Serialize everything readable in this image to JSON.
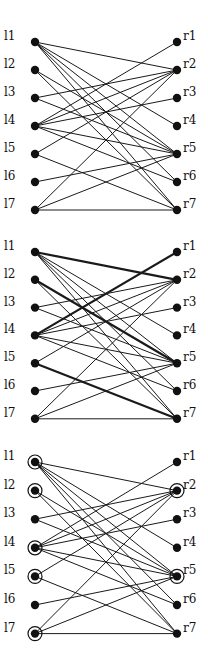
{
  "diagram": {
    "type": "bipartite-graphs",
    "left_nodes": [
      "l1",
      "l2",
      "l3",
      "l4",
      "l5",
      "l6",
      "l7"
    ],
    "right_nodes": [
      "r1",
      "r2",
      "r3",
      "r4",
      "r5",
      "r6",
      "r7"
    ],
    "edges": [
      [
        "l1",
        "r2"
      ],
      [
        "l1",
        "r4"
      ],
      [
        "l1",
        "r5"
      ],
      [
        "l1",
        "r7"
      ],
      [
        "l1",
        "r6"
      ],
      [
        "l2",
        "r5"
      ],
      [
        "l2",
        "r7"
      ],
      [
        "l3",
        "r2"
      ],
      [
        "l3",
        "r5"
      ],
      [
        "l4",
        "r1"
      ],
      [
        "l4",
        "r2"
      ],
      [
        "l4",
        "r3"
      ],
      [
        "l4",
        "r5"
      ],
      [
        "l4",
        "r6"
      ],
      [
        "l5",
        "r2"
      ],
      [
        "l5",
        "r7"
      ],
      [
        "l6",
        "r5"
      ],
      [
        "l7",
        "r2"
      ],
      [
        "l7",
        "r5"
      ],
      [
        "l7",
        "r7"
      ]
    ],
    "panels": [
      {
        "name": "graph",
        "top": 42,
        "spacing": 28,
        "bold_edges": [],
        "circled_nodes": []
      },
      {
        "name": "matching",
        "top": 252,
        "spacing": 27.8,
        "bold_edges": [
          [
            "l1",
            "r2"
          ],
          [
            "l2",
            "r5"
          ],
          [
            "l4",
            "r1"
          ],
          [
            "l5",
            "r7"
          ]
        ],
        "circled_nodes": []
      },
      {
        "name": "vertex-cover",
        "top": 462,
        "spacing": 28.6,
        "bold_edges": [],
        "circled_nodes": [
          "l1",
          "l2",
          "l4",
          "l5",
          "l7",
          "r2",
          "r5"
        ]
      }
    ],
    "colors": {
      "edge": "#1a1a1a",
      "node": "#111111"
    }
  }
}
